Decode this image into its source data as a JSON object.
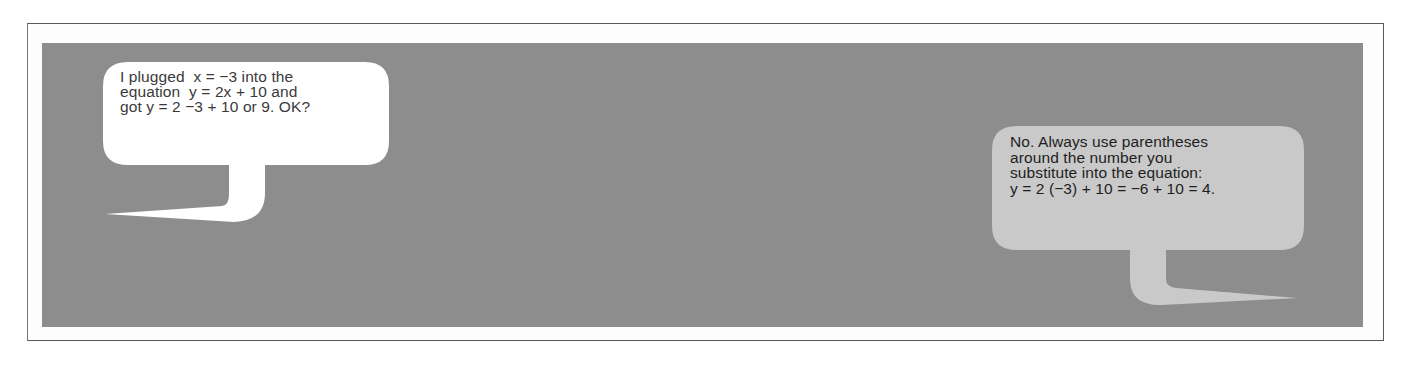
{
  "colors": {
    "frame_border": "#5a5a5a",
    "panel_background": "#8d8d8d",
    "left_bubble_fill": "#ffffff",
    "right_bubble_fill": "#c9c9c9",
    "left_text_color": "#3a3a3a",
    "right_text_color": "#1e1e1e"
  },
  "left_bubble": {
    "speaker": "student",
    "tail_direction": "down-left",
    "lines": [
      "I plugged  x = −3 into the",
      "equation  y = 2x + 10 and",
      "got y = 2 −3 + 10 or 9. OK?"
    ]
  },
  "right_bubble": {
    "speaker": "tutor",
    "tail_direction": "down-right",
    "lines": [
      "No. Always use parentheses",
      "around the number you",
      "substitute into the equation:",
      "y = 2 (−3) + 10 = −6 + 10 = 4."
    ]
  }
}
